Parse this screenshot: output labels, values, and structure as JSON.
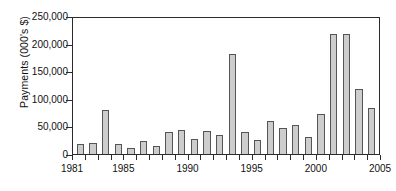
{
  "chart_data": {
    "type": "bar",
    "title": "",
    "xlabel": "",
    "ylabel": "Payments (000's $)",
    "categories": [
      "1981",
      "1982",
      "1983",
      "1984",
      "1985",
      "1986",
      "1987",
      "1988",
      "1989",
      "1990",
      "1991",
      "1992",
      "1993",
      "1994",
      "1995",
      "1996",
      "1997",
      "1998",
      "1999",
      "2000",
      "2001",
      "2002",
      "2003",
      "2004"
    ],
    "values": [
      19000,
      20000,
      80000,
      19000,
      11000,
      23000,
      15000,
      39000,
      43000,
      28000,
      42000,
      34000,
      181000,
      40000,
      26000,
      59000,
      47000,
      53000,
      30000,
      72000,
      217000,
      218000,
      118000,
      84000
    ],
    "ylim": [
      0,
      250000
    ],
    "xlim": [
      1981,
      2005
    ],
    "y_ticks": [
      0,
      50000,
      100000,
      150000,
      200000,
      250000
    ],
    "y_tick_labels": [
      "0",
      "50,000",
      "100,000",
      "150,000",
      "200,000",
      "250,000"
    ],
    "x_ticks": [
      1981,
      1982,
      1983,
      1984,
      1985,
      1986,
      1987,
      1988,
      1989,
      1990,
      1991,
      1992,
      1993,
      1994,
      1995,
      1996,
      1997,
      1998,
      1999,
      2000,
      2001,
      2002,
      2003,
      2004,
      2005
    ],
    "x_tick_labels": [
      "1981",
      "1985",
      "1990",
      "1995",
      "2000",
      "2005"
    ],
    "x_tick_label_values": [
      1981,
      1985,
      1990,
      1995,
      2000,
      2005
    ],
    "grid": false,
    "legend": null,
    "bar_fill_color": "#cdcdcd",
    "bar_edge_color": "#555555",
    "axis_color": "#2b2b2b",
    "background_color": "#ffffff"
  }
}
